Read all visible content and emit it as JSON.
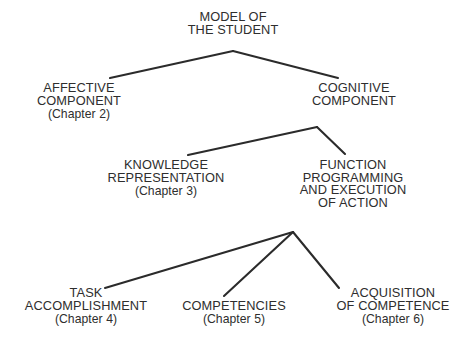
{
  "diagram": {
    "type": "hierarchy-tree",
    "background_color": "#ffffff",
    "line_color": "#2b2b2b",
    "text_color": "#2e2e2e",
    "width": 465,
    "height": 352,
    "nodes": [
      {
        "id": "model-of-the-student",
        "level": 0,
        "lines": [
          "MODEL OF",
          "THE STUDENT"
        ],
        "chapter": "",
        "x": 233,
        "y": 11
      },
      {
        "id": "affective-component",
        "level": 1,
        "lines": [
          "AFFECTIVE",
          "COMPONENT"
        ],
        "chapter": "(Chapter 2)",
        "x": 79,
        "y": 82
      },
      {
        "id": "cognitive-component",
        "level": 1,
        "lines": [
          "COGNITIVE",
          "COMPONENT"
        ],
        "chapter": "",
        "x": 354,
        "y": 82
      },
      {
        "id": "knowledge-representation",
        "level": 2,
        "lines": [
          "KNOWLEDGE",
          "REPRESENTATION"
        ],
        "chapter": "(Chapter 3)",
        "x": 166,
        "y": 159
      },
      {
        "id": "function-programming-and-execution-of-action",
        "level": 2,
        "lines": [
          "FUNCTION",
          "PROGRAMMING",
          "AND EXECUTION",
          "OF ACTION"
        ],
        "chapter": "",
        "x": 353,
        "y": 159
      },
      {
        "id": "task-accomplishment",
        "level": 3,
        "lines": [
          "TASK",
          "ACCOMPLISHMENT"
        ],
        "chapter": "(Chapter 4)",
        "x": 86,
        "y": 287
      },
      {
        "id": "competencies",
        "level": 3,
        "lines": [
          "COMPETENCIES"
        ],
        "chapter": "(Chapter 5)",
        "x": 234,
        "y": 300
      },
      {
        "id": "acquisition-of-competence",
        "level": 3,
        "lines": [
          "ACQUISITION",
          "OF COMPETENCE"
        ],
        "chapter": "(Chapter 6)",
        "x": 393,
        "y": 287
      }
    ],
    "connectors": [
      {
        "id": "model-to-affective",
        "from": "model-of-the-student",
        "to": "affective-component",
        "x1": 233,
        "y1": 51,
        "x2": 110,
        "y2": 78
      },
      {
        "id": "model-to-cognitive",
        "from": "model-of-the-student",
        "to": "cognitive-component",
        "x1": 233,
        "y1": 51,
        "x2": 338,
        "y2": 78
      },
      {
        "id": "cognitive-to-knowledge",
        "from": "cognitive-component",
        "to": "knowledge-representation",
        "x1": 317,
        "y1": 127,
        "x2": 188,
        "y2": 155
      },
      {
        "id": "cognitive-to-function",
        "from": "cognitive-component",
        "to": "function-programming-and-execution-of-action",
        "x1": 317,
        "y1": 127,
        "x2": 345,
        "y2": 154
      },
      {
        "id": "function-to-task",
        "from": "function-programming-and-execution-of-action",
        "to": "task-accomplishment",
        "x1": 293,
        "y1": 232,
        "x2": 105,
        "y2": 288
      },
      {
        "id": "function-to-competencies",
        "from": "function-programming-and-execution-of-action",
        "to": "competencies",
        "x1": 293,
        "y1": 232,
        "x2": 224,
        "y2": 296
      },
      {
        "id": "function-to-acquisition",
        "from": "function-programming-and-execution-of-action",
        "to": "acquisition-of-competence",
        "x1": 293,
        "y1": 232,
        "x2": 339,
        "y2": 288
      }
    ]
  }
}
